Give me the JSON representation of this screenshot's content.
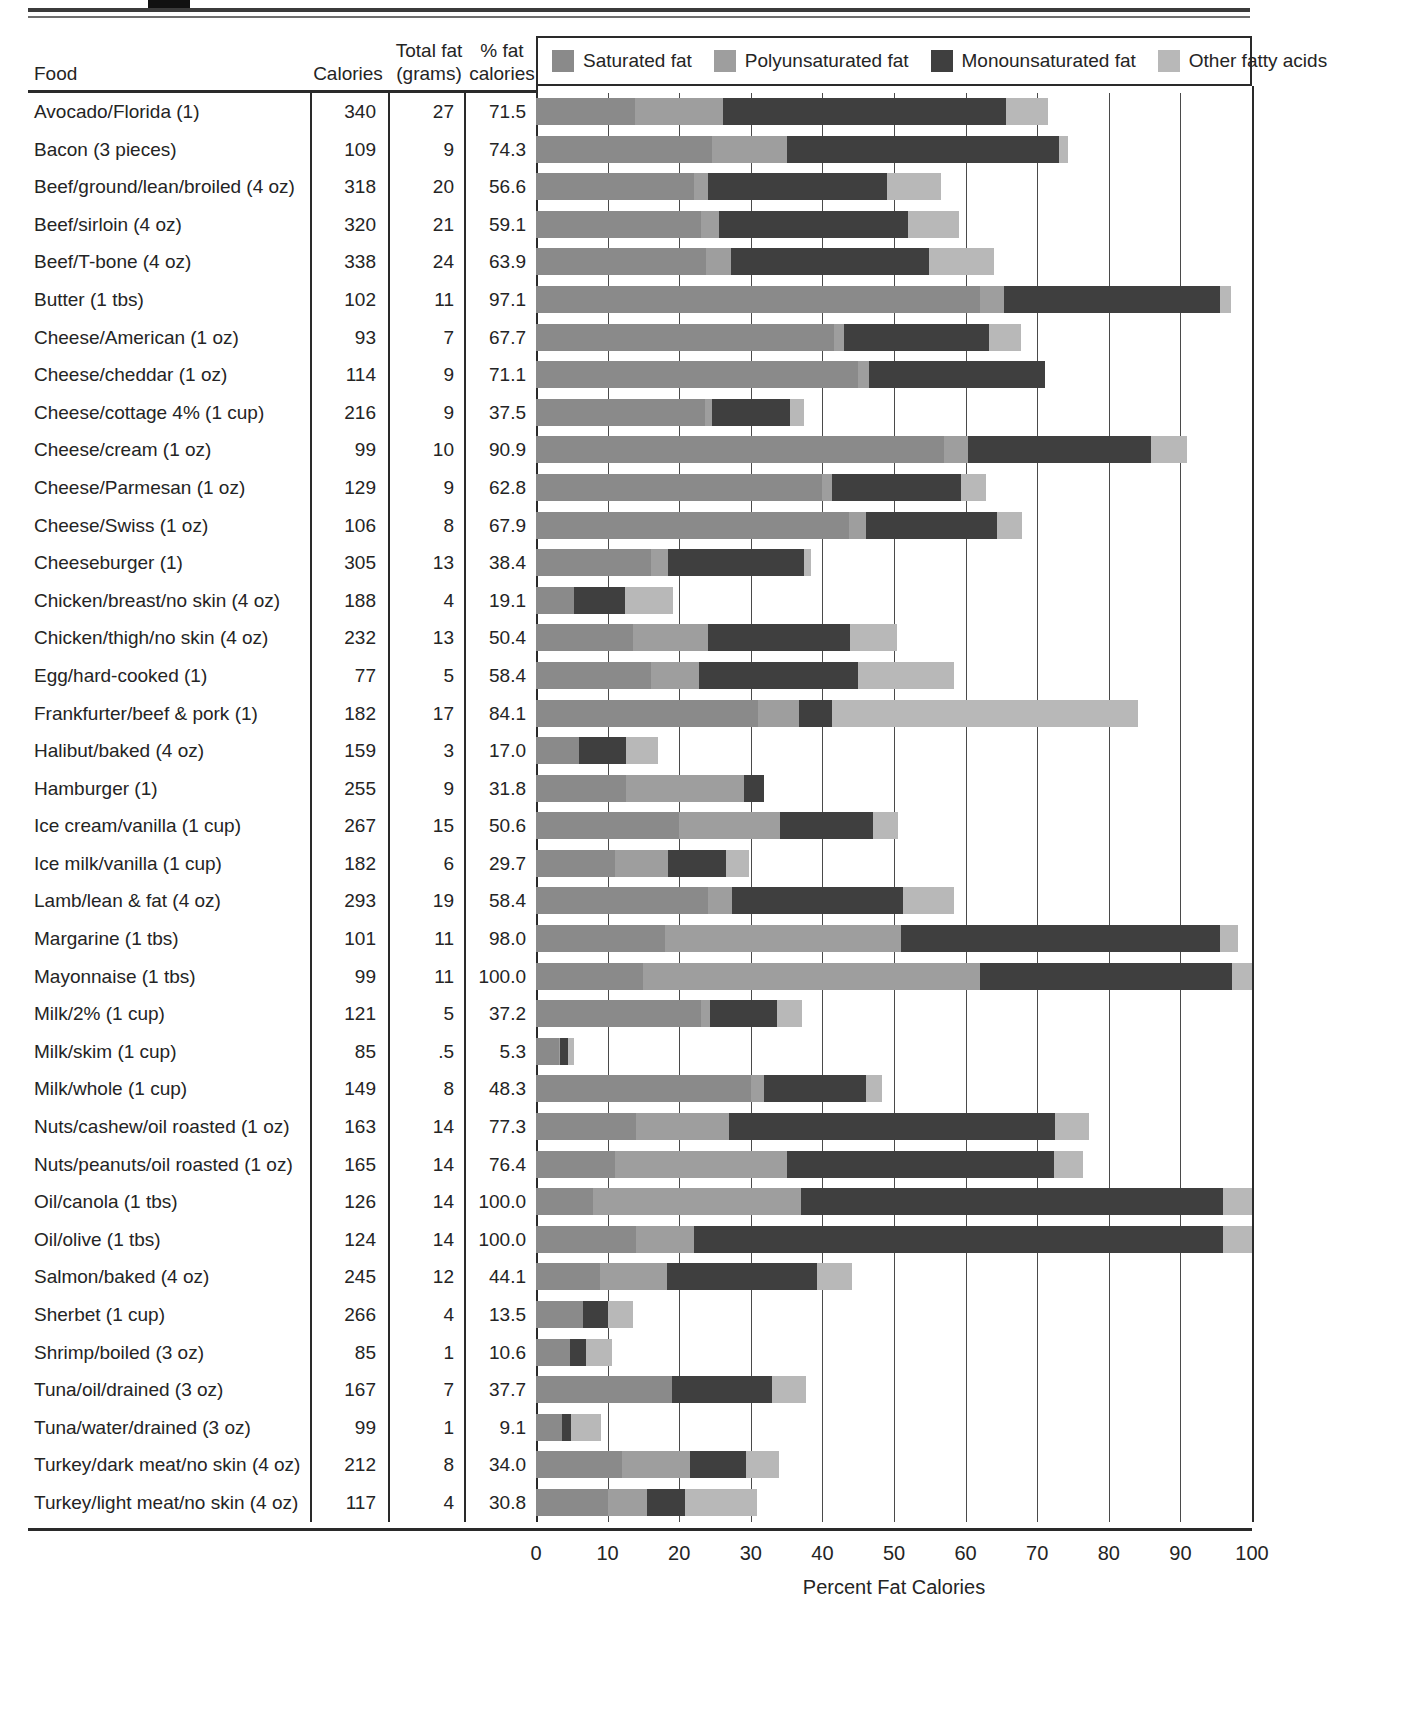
{
  "table": {
    "headers": {
      "food": "Food",
      "calories": "Calories",
      "total_fat": "Total fat\n(grams)",
      "pct_fat_calories": "% fat\ncalories"
    }
  },
  "legend": {
    "items": [
      {
        "label": "Saturated fat",
        "color": "#8a8a8a"
      },
      {
        "label": "Polyunsaturated fat",
        "color": "#9e9e9e"
      },
      {
        "label": "Monounsaturated fat",
        "color": "#3f3f3f"
      },
      {
        "label": "Other fatty acids",
        "color": "#b8b8b8"
      }
    ]
  },
  "axis": {
    "title": "Percent Fat Calories",
    "ticks": [
      0,
      10,
      20,
      30,
      40,
      50,
      60,
      70,
      80,
      90,
      100
    ],
    "min": 0,
    "max": 100
  },
  "chart_data": {
    "type": "bar",
    "title": "Percent Fat Calories",
    "xlabel": "Percent Fat Calories",
    "ylabel": "Food",
    "xlim": [
      0,
      100
    ],
    "grid": true,
    "legend_position": "top",
    "stacked": true,
    "orientation": "horizontal",
    "series": [
      {
        "name": "Saturated fat",
        "color": "#8a8a8a"
      },
      {
        "name": "Polyunsaturated fat",
        "color": "#9e9e9e"
      },
      {
        "name": "Monounsaturated fat",
        "color": "#3f3f3f"
      },
      {
        "name": "Other fatty acids",
        "color": "#b8b8b8"
      }
    ],
    "categories": [
      "Avocado/Florida (1)",
      "Bacon (3 pieces)",
      "Beef/ground/lean/broiled (4 oz)",
      "Beef/sirloin (4 oz)",
      "Beef/T-bone (4 oz)",
      "Butter (1 tbs)",
      "Cheese/American (1 oz)",
      "Cheese/cheddar (1 oz)",
      "Cheese/cottage 4% (1 cup)",
      "Cheese/cream (1 oz)",
      "Cheese/Parmesan (1 oz)",
      "Cheese/Swiss (1 oz)",
      "Cheeseburger (1)",
      "Chicken/breast/no skin (4 oz)",
      "Chicken/thigh/no skin (4 oz)",
      "Egg/hard-cooked (1)",
      "Frankfurter/beef & pork (1)",
      "Halibut/baked (4 oz)",
      "Hamburger (1)",
      "Ice cream/vanilla (1 cup)",
      "Ice milk/vanilla (1 cup)",
      "Lamb/lean & fat (4 oz)",
      "Margarine (1 tbs)",
      "Mayonnaise (1 tbs)",
      "Milk/2% (1 cup)",
      "Milk/skim (1 cup)",
      "Milk/whole (1 cup)",
      "Nuts/cashew/oil roasted (1 oz)",
      "Nuts/peanuts/oil roasted (1 oz)",
      "Oil/canola (1 tbs)",
      "Oil/olive (1 tbs)",
      "Salmon/baked (4 oz)",
      "Sherbet (1 cup)",
      "Shrimp/boiled (3 oz)",
      "Tuna/oil/drained (3 oz)",
      "Tuna/water/drained (3 oz)",
      "Turkey/dark meat/no skin (4 oz)",
      "Turkey/light meat/no skin (4 oz)"
    ],
    "rows": [
      {
        "food": "Avocado/Florida (1)",
        "calories": "340",
        "total_fat": "27",
        "pct_fat_calories": "71.5",
        "saturated": 13.8,
        "polyunsaturated": 12.3,
        "monounsaturated": 39.6,
        "other": 5.8
      },
      {
        "food": "Bacon (3 pieces)",
        "calories": "109",
        "total_fat": "9",
        "pct_fat_calories": "74.3",
        "saturated": 24.6,
        "polyunsaturated": 10.4,
        "monounsaturated": 38.0,
        "other": 1.3
      },
      {
        "food": "Beef/ground/lean/broiled (4 oz)",
        "calories": "318",
        "total_fat": "20",
        "pct_fat_calories": "56.6",
        "saturated": 22.0,
        "polyunsaturated": 2.0,
        "monounsaturated": 25.0,
        "other": 7.6
      },
      {
        "food": "Beef/sirloin (4 oz)",
        "calories": "320",
        "total_fat": "21",
        "pct_fat_calories": "59.1",
        "saturated": 23.0,
        "polyunsaturated": 2.6,
        "monounsaturated": 26.4,
        "other": 7.1
      },
      {
        "food": "Beef/T-bone (4 oz)",
        "calories": "338",
        "total_fat": "24",
        "pct_fat_calories": "63.9",
        "saturated": 23.8,
        "polyunsaturated": 3.5,
        "monounsaturated": 27.6,
        "other": 9.0
      },
      {
        "food": "Butter (1 tbs)",
        "calories": "102",
        "total_fat": "11",
        "pct_fat_calories": "97.1",
        "saturated": 62.0,
        "polyunsaturated": 3.4,
        "monounsaturated": 30.2,
        "other": 1.5
      },
      {
        "food": "Cheese/American (1 oz)",
        "calories": "93",
        "total_fat": "7",
        "pct_fat_calories": "67.7",
        "saturated": 41.6,
        "polyunsaturated": 1.4,
        "monounsaturated": 20.3,
        "other": 4.4
      },
      {
        "food": "Cheese/cheddar (1 oz)",
        "calories": "114",
        "total_fat": "9",
        "pct_fat_calories": "71.1",
        "saturated": 45.0,
        "polyunsaturated": 1.5,
        "monounsaturated": 24.6,
        "other": 0.0
      },
      {
        "food": "Cheese/cottage 4% (1 cup)",
        "calories": "216",
        "total_fat": "9",
        "pct_fat_calories": "37.5",
        "saturated": 23.6,
        "polyunsaturated": 1.0,
        "monounsaturated": 10.9,
        "other": 2.0
      },
      {
        "food": "Cheese/cream (1 oz)",
        "calories": "99",
        "total_fat": "10",
        "pct_fat_calories": "90.9",
        "saturated": 57.0,
        "polyunsaturated": 3.3,
        "monounsaturated": 25.6,
        "other": 5.0
      },
      {
        "food": "Cheese/Parmesan (1 oz)",
        "calories": "129",
        "total_fat": "9",
        "pct_fat_calories": "62.8",
        "saturated": 39.9,
        "polyunsaturated": 1.4,
        "monounsaturated": 18.0,
        "other": 3.5
      },
      {
        "food": "Cheese/Swiss (1 oz)",
        "calories": "106",
        "total_fat": "8",
        "pct_fat_calories": "67.9",
        "saturated": 43.7,
        "polyunsaturated": 2.4,
        "monounsaturated": 18.3,
        "other": 3.5
      },
      {
        "food": "Cheeseburger (1)",
        "calories": "305",
        "total_fat": "13",
        "pct_fat_calories": "38.4",
        "saturated": 16.0,
        "polyunsaturated": 2.4,
        "monounsaturated": 19.0,
        "other": 1.0
      },
      {
        "food": "Chicken/breast/no skin (4 oz)",
        "calories": "188",
        "total_fat": "4",
        "pct_fat_calories": "19.1",
        "saturated": 5.3,
        "polyunsaturated": 0.0,
        "monounsaturated": 7.1,
        "other": 6.7
      },
      {
        "food": "Chicken/thigh/no skin (4 oz)",
        "calories": "232",
        "total_fat": "13",
        "pct_fat_calories": "50.4",
        "saturated": 13.5,
        "polyunsaturated": 10.5,
        "monounsaturated": 19.9,
        "other": 6.5
      },
      {
        "food": "Egg/hard-cooked (1)",
        "calories": "77",
        "total_fat": "5",
        "pct_fat_calories": "58.4",
        "saturated": 16.0,
        "polyunsaturated": 6.7,
        "monounsaturated": 22.3,
        "other": 13.4
      },
      {
        "food": "Frankfurter/beef & pork (1)",
        "calories": "182",
        "total_fat": "17",
        "pct_fat_calories": "84.1",
        "saturated": 31.0,
        "polyunsaturated": 5.8,
        "monounsaturated": 4.6,
        "other": 42.7
      },
      {
        "food": "Halibut/baked (4 oz)",
        "calories": "159",
        "total_fat": "3",
        "pct_fat_calories": "17.0",
        "saturated": 6.0,
        "polyunsaturated": 0.0,
        "monounsaturated": 6.6,
        "other": 4.4
      },
      {
        "food": "Hamburger (1)",
        "calories": "255",
        "total_fat": "9",
        "pct_fat_calories": "31.8",
        "saturated": 12.6,
        "polyunsaturated": 16.5,
        "monounsaturated": 2.7,
        "other": 0.0
      },
      {
        "food": "Ice cream/vanilla (1 cup)",
        "calories": "267",
        "total_fat": "15",
        "pct_fat_calories": "50.6",
        "saturated": 20.0,
        "polyunsaturated": 14.1,
        "monounsaturated": 13.0,
        "other": 3.5
      },
      {
        "food": "Ice milk/vanilla (1 cup)",
        "calories": "182",
        "total_fat": "6",
        "pct_fat_calories": "29.7",
        "saturated": 11.0,
        "polyunsaturated": 7.5,
        "monounsaturated": 8.0,
        "other": 3.2
      },
      {
        "food": "Lamb/lean & fat (4 oz)",
        "calories": "293",
        "total_fat": "19",
        "pct_fat_calories": "58.4",
        "saturated": 24.0,
        "polyunsaturated": 3.4,
        "monounsaturated": 23.8,
        "other": 7.2
      },
      {
        "food": "Margarine (1 tbs)",
        "calories": "101",
        "total_fat": "11",
        "pct_fat_calories": "98.0",
        "saturated": 18.0,
        "polyunsaturated": 33.0,
        "monounsaturated": 44.5,
        "other": 2.5
      },
      {
        "food": "Mayonnaise (1 tbs)",
        "calories": "99",
        "total_fat": "11",
        "pct_fat_calories": "100.0",
        "saturated": 15.0,
        "polyunsaturated": 47.0,
        "monounsaturated": 35.2,
        "other": 2.8
      },
      {
        "food": "Milk/2% (1 cup)",
        "calories": "121",
        "total_fat": "5",
        "pct_fat_calories": "37.2",
        "saturated": 23.0,
        "polyunsaturated": 1.3,
        "monounsaturated": 9.3,
        "other": 3.6
      },
      {
        "food": "Milk/skim (1 cup)",
        "calories": "85",
        "total_fat": ".5",
        "pct_fat_calories": "5.3",
        "saturated": 3.2,
        "polyunsaturated": 0.1,
        "monounsaturated": 1.2,
        "other": 0.8
      },
      {
        "food": "Milk/whole (1 cup)",
        "calories": "149",
        "total_fat": "8",
        "pct_fat_calories": "48.3",
        "saturated": 30.0,
        "polyunsaturated": 1.8,
        "monounsaturated": 14.3,
        "other": 2.2
      },
      {
        "food": "Nuts/cashew/oil roasted (1 oz)",
        "calories": "163",
        "total_fat": "14",
        "pct_fat_calories": "77.3",
        "saturated": 14.0,
        "polyunsaturated": 13.0,
        "monounsaturated": 45.5,
        "other": 4.8
      },
      {
        "food": "Nuts/peanuts/oil roasted (1 oz)",
        "calories": "165",
        "total_fat": "14",
        "pct_fat_calories": "76.4",
        "saturated": 11.0,
        "polyunsaturated": 24.0,
        "monounsaturated": 37.4,
        "other": 4.0
      },
      {
        "food": "Oil/canola (1 tbs)",
        "calories": "126",
        "total_fat": "14",
        "pct_fat_calories": "100.0",
        "saturated": 8.0,
        "polyunsaturated": 29.0,
        "monounsaturated": 59.0,
        "other": 4.0
      },
      {
        "food": "Oil/olive (1 tbs)",
        "calories": "124",
        "total_fat": "14",
        "pct_fat_calories": "100.0",
        "saturated": 14.0,
        "polyunsaturated": 8.0,
        "monounsaturated": 74.0,
        "other": 4.0
      },
      {
        "food": "Salmon/baked (4 oz)",
        "calories": "245",
        "total_fat": "12",
        "pct_fat_calories": "44.1",
        "saturated": 9.0,
        "polyunsaturated": 9.3,
        "monounsaturated": 21.0,
        "other": 4.8
      },
      {
        "food": "Sherbet (1 cup)",
        "calories": "266",
        "total_fat": "4",
        "pct_fat_calories": "13.5",
        "saturated": 6.5,
        "polyunsaturated": 0.0,
        "monounsaturated": 3.5,
        "other": 3.5
      },
      {
        "food": "Shrimp/boiled (3 oz)",
        "calories": "85",
        "total_fat": "1",
        "pct_fat_calories": "10.6",
        "saturated": 4.8,
        "polyunsaturated": 0.0,
        "monounsaturated": 2.2,
        "other": 3.6
      },
      {
        "food": "Tuna/oil/drained (3 oz)",
        "calories": "167",
        "total_fat": "7",
        "pct_fat_calories": "37.7",
        "saturated": 19.0,
        "polyunsaturated": 0.0,
        "monounsaturated": 14.0,
        "other": 4.7
      },
      {
        "food": "Tuna/water/drained (3 oz)",
        "calories": "99",
        "total_fat": "1",
        "pct_fat_calories": "9.1",
        "saturated": 3.6,
        "polyunsaturated": 0.0,
        "monounsaturated": 1.3,
        "other": 4.2
      },
      {
        "food": "Turkey/dark meat/no skin (4 oz)",
        "calories": "212",
        "total_fat": "8",
        "pct_fat_calories": "34.0",
        "saturated": 12.0,
        "polyunsaturated": 9.5,
        "monounsaturated": 7.8,
        "other": 4.7
      },
      {
        "food": "Turkey/light meat/no skin (4 oz)",
        "calories": "117",
        "total_fat": "4",
        "pct_fat_calories": "30.8",
        "saturated": 10.0,
        "polyunsaturated": 5.5,
        "monounsaturated": 5.3,
        "other": 10.0
      }
    ]
  }
}
